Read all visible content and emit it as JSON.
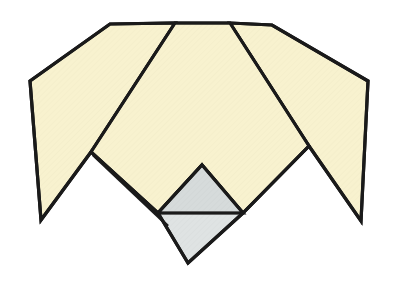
{
  "figure": {
    "title": "Origami fold step diagram",
    "canvas": {
      "width": 398,
      "height": 287
    },
    "background_color": "#ffffff"
  },
  "palette": {
    "paper_front": "#f8f2cf",
    "paper_front_shade": "#f5eec5",
    "paper_back": "#dfe3e3",
    "paper_back_shade": "#d6dbdb",
    "outline": "#1a1a1a",
    "background": "#ffffff"
  },
  "stroke_widths": {
    "outline": 3.2,
    "fold": 2.6
  },
  "shapes": [
    {
      "id": "left-wing",
      "name": "left-wing-flap",
      "fill_key": "paper_front",
      "points": "110,24 175,23 91,152 41,220 30,81"
    },
    {
      "id": "right-wing",
      "name": "right-wing-flap",
      "fill_key": "paper_front",
      "points": "230,23 272,25 368,81 361,221 309,146"
    },
    {
      "id": "center-body",
      "name": "center-body-panel",
      "fill_key": "paper_front",
      "points": "175,23 230,23 309,146 243,213 202,165 158,213 91,152"
    },
    {
      "id": "back-diamond",
      "name": "back-side-diamond-flap",
      "fill_key": "paper_back",
      "points": "202,165 243,213 188,263 158,213"
    },
    {
      "id": "back-diamond-upper",
      "name": "back-side-triangle-highlight",
      "fill_key": "paper_back_shade",
      "points": "202,165 243,213 158,213"
    }
  ],
  "fold_lines": [
    {
      "id": "fold-left",
      "name": "left-wing-fold-line",
      "path": "M175,23 L91,152"
    },
    {
      "id": "fold-right",
      "name": "right-wing-fold-line",
      "path": "M230,23 L309,146"
    },
    {
      "id": "fold-notch-left",
      "name": "left-notch-crease",
      "path": "M91,152 L158,213"
    },
    {
      "id": "fold-notch-left-inner",
      "name": "left-notch-inner-crease",
      "path": "M93,155 L168,226"
    },
    {
      "id": "fold-diamond-top-left",
      "name": "diamond-upper-left-edge",
      "path": "M158,213 L202,165"
    },
    {
      "id": "fold-diamond-top-right",
      "name": "diamond-upper-right-edge",
      "path": "M202,165 L243,213"
    },
    {
      "id": "fold-diamond-waist",
      "name": "diamond-horizontal-crease",
      "path": "M158,213 L243,213"
    },
    {
      "id": "fold-body-right",
      "name": "body-lower-right-edge",
      "path": "M243,213 L309,146"
    }
  ],
  "vertices": [
    {
      "name": "top-left-corner",
      "x": 110,
      "y": 24
    },
    {
      "name": "top-fold-left",
      "x": 175,
      "y": 23
    },
    {
      "name": "top-fold-right",
      "x": 230,
      "y": 23
    },
    {
      "name": "top-right-corner",
      "x": 272,
      "y": 25
    },
    {
      "name": "left-outer-vertex",
      "x": 30,
      "y": 81
    },
    {
      "name": "right-outer-vertex",
      "x": 368,
      "y": 81
    },
    {
      "name": "left-wing-tip",
      "x": 41,
      "y": 220
    },
    {
      "name": "right-wing-tip",
      "x": 361,
      "y": 221
    },
    {
      "name": "left-notch-peak",
      "x": 91,
      "y": 152
    },
    {
      "name": "right-notch-peak",
      "x": 309,
      "y": 146
    },
    {
      "name": "diamond-top",
      "x": 202,
      "y": 165
    },
    {
      "name": "diamond-left",
      "x": 158,
      "y": 213
    },
    {
      "name": "diamond-right",
      "x": 243,
      "y": 213
    },
    {
      "name": "diamond-bottom",
      "x": 188,
      "y": 263
    }
  ]
}
